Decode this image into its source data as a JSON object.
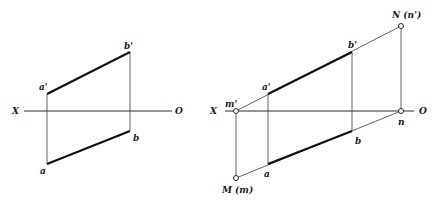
{
  "figure": {
    "left": {
      "axis": {
        "left_label": "X",
        "right_label": "O"
      },
      "points": {
        "a_prime": "a'",
        "b_prime": "b'",
        "a": "a",
        "b": "b"
      }
    },
    "right": {
      "axis": {
        "left_label": "X",
        "right_label": "O"
      },
      "points": {
        "m_prime": "m'",
        "M": "M (m)",
        "N": "N (n')",
        "n": "n",
        "a_prime": "a'",
        "b_prime": "b'",
        "a": "a",
        "b": "b"
      }
    }
  },
  "colors": {
    "line": "#111111",
    "background": "#ffffff"
  }
}
